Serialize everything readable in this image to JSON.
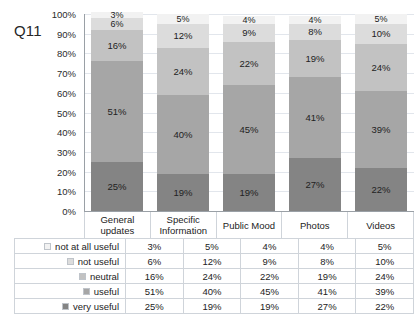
{
  "chart_title": "Q11",
  "chart_data": {
    "type": "bar",
    "subtype": "stacked-bar-100",
    "title": "Q11",
    "xlabel": "",
    "ylabel": "",
    "ylim": [
      0,
      100
    ],
    "grid": true,
    "legend_position": "table-below",
    "categories": [
      "General updates",
      "Specific Information",
      "Public Mood",
      "Photos",
      "Videos"
    ],
    "category_lines": [
      [
        "General",
        "updates"
      ],
      [
        "Specific",
        "Information"
      ],
      [
        "Public Mood",
        ""
      ],
      [
        "Photos",
        ""
      ],
      [
        "Videos",
        ""
      ]
    ],
    "ytick_labels": [
      "100%",
      "90%",
      "80%",
      "70%",
      "60%",
      "50%",
      "40%",
      "30%",
      "20%",
      "10%",
      "0%"
    ],
    "ytick_values": [
      100,
      90,
      80,
      70,
      60,
      50,
      40,
      30,
      20,
      10,
      0
    ],
    "stack_order_bottom_to_top": [
      "very useful",
      "useful",
      "neutral",
      "not useful",
      "not at all useful"
    ],
    "series": [
      {
        "name": "not at all useful",
        "color": "#f2f2f2",
        "values": [
          3,
          5,
          4,
          4,
          5
        ],
        "labels": [
          "3%",
          "5%",
          "4%",
          "4%",
          "5%"
        ]
      },
      {
        "name": "not useful",
        "color": "#dcdcdc",
        "values": [
          6,
          12,
          9,
          8,
          10
        ],
        "labels": [
          "6%",
          "12%",
          "9%",
          "8%",
          "10%"
        ]
      },
      {
        "name": "neutral",
        "color": "#c2c2c2",
        "values": [
          16,
          24,
          22,
          19,
          24
        ],
        "labels": [
          "16%",
          "24%",
          "22%",
          "19%",
          "24%"
        ]
      },
      {
        "name": "useful",
        "color": "#a6a6a6",
        "values": [
          51,
          40,
          45,
          41,
          39
        ],
        "labels": [
          "51%",
          "40%",
          "45%",
          "41%",
          "39%"
        ]
      },
      {
        "name": "very useful",
        "color": "#848484",
        "values": [
          25,
          19,
          19,
          27,
          22
        ],
        "labels": [
          "25%",
          "19%",
          "19%",
          "27%",
          "22%"
        ]
      }
    ]
  },
  "table": {
    "rows": [
      {
        "label": "not at all useful",
        "swatch": "#f2f2f2",
        "cells": [
          "3%",
          "5%",
          "4%",
          "4%",
          "5%"
        ]
      },
      {
        "label": "not useful",
        "swatch": "#dcdcdc",
        "cells": [
          "6%",
          "12%",
          "9%",
          "8%",
          "10%"
        ]
      },
      {
        "label": "neutral",
        "swatch": "#c2c2c2",
        "cells": [
          "16%",
          "24%",
          "22%",
          "19%",
          "24%"
        ]
      },
      {
        "label": "useful",
        "swatch": "#a6a6a6",
        "cells": [
          "51%",
          "40%",
          "45%",
          "41%",
          "39%"
        ]
      },
      {
        "label": "very useful",
        "swatch": "#848484",
        "cells": [
          "25%",
          "19%",
          "19%",
          "27%",
          "22%"
        ]
      }
    ]
  }
}
